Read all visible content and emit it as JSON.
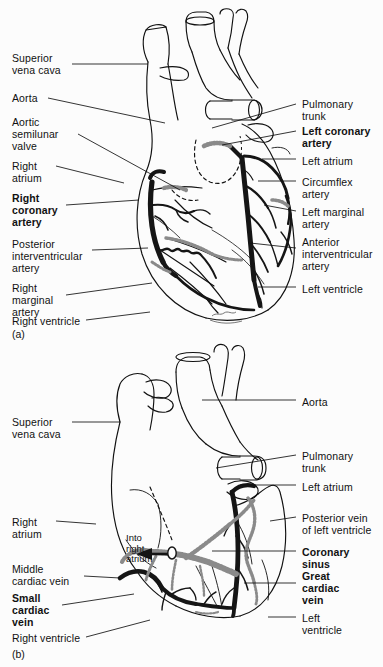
{
  "figure": {
    "background_color": "#fcfcfc",
    "ink_color": "#111111",
    "vessel_dark_color": "#151515",
    "vessel_gray_color": "#8a8a8a"
  },
  "panels": [
    {
      "id": "a",
      "letter": "(a)",
      "view": "anterior view - coronary arteries",
      "labels_left": [
        {
          "text": "Superior\nvena cava",
          "bold": false,
          "x": 12,
          "y": 52,
          "leader_x1": 72,
          "leader_y1": 64,
          "leader_x2": 148,
          "leader_y2": 64
        },
        {
          "text": "Aorta",
          "bold": false,
          "x": 12,
          "y": 92,
          "leader_x1": 48,
          "leader_y1": 98,
          "leader_x2": 165,
          "leader_y2": 123
        },
        {
          "text": "Aortic\nsemilunar\nvalve",
          "bold": false,
          "x": 12,
          "y": 116,
          "leader_x1": 78,
          "leader_y1": 134,
          "leader_x2": 180,
          "leader_y2": 190
        },
        {
          "text": "Right\natrium",
          "bold": false,
          "x": 12,
          "y": 160,
          "leader_x1": 56,
          "leader_y1": 166,
          "leader_x2": 124,
          "leader_y2": 183
        },
        {
          "text": "Right\ncoronary\nartery",
          "bold": true,
          "x": 12,
          "y": 192,
          "leader_x1": 66,
          "leader_y1": 205,
          "leader_x2": 139,
          "leader_y2": 200
        },
        {
          "text": "Posterior\ninterventricular\nartery",
          "bold": false,
          "x": 12,
          "y": 238,
          "leader_x1": 92,
          "leader_y1": 250,
          "leader_x2": 148,
          "leader_y2": 248
        },
        {
          "text": "Right\nmarginal\nartery",
          "bold": false,
          "x": 12,
          "y": 282,
          "leader_x1": 66,
          "leader_y1": 295,
          "leader_x2": 152,
          "leader_y2": 283
        },
        {
          "text": "Right ventricle",
          "bold": false,
          "x": 12,
          "y": 315,
          "leader_x1": 86,
          "leader_y1": 320,
          "leader_x2": 150,
          "leader_y2": 312
        }
      ],
      "labels_right": [
        {
          "text": "Pulmonary\ntrunk",
          "bold": false,
          "x": 302,
          "y": 98,
          "leader_x1": 296,
          "leader_y1": 104,
          "leader_x2": 212,
          "leader_y2": 128
        },
        {
          "text": "Left coronary\nartery",
          "bold": true,
          "x": 302,
          "y": 125,
          "leader_x1": 296,
          "leader_y1": 131,
          "leader_x2": 222,
          "leader_y2": 145
        },
        {
          "text": "Left atrium",
          "bold": false,
          "x": 302,
          "y": 155,
          "leader_x1": 296,
          "leader_y1": 159,
          "leader_x2": 262,
          "leader_y2": 159
        },
        {
          "text": "Circumflex\nartery",
          "bold": false,
          "x": 302,
          "y": 176,
          "leader_x1": 296,
          "leader_y1": 181,
          "leader_x2": 258,
          "leader_y2": 181
        },
        {
          "text": "Left marginal\nartery",
          "bold": false,
          "x": 302,
          "y": 206,
          "leader_x1": 296,
          "leader_y1": 211,
          "leader_x2": 264,
          "leader_y2": 205
        },
        {
          "text": "Anterior\ninterventricular\nartery",
          "bold": false,
          "x": 302,
          "y": 236,
          "leader_x1": 296,
          "leader_y1": 248,
          "leader_x2": 250,
          "leader_y2": 243
        },
        {
          "text": "Left ventricle",
          "bold": false,
          "x": 302,
          "y": 283,
          "leader_x1": 296,
          "leader_y1": 287,
          "leader_x2": 258,
          "leader_y2": 287
        }
      ],
      "annotations": []
    },
    {
      "id": "b",
      "letter": "(b)",
      "view": "posterior view - cardiac veins",
      "labels_left": [
        {
          "text": "Superior\nvena cava",
          "bold": false,
          "x": 12,
          "y": 416,
          "leader_x1": 72,
          "leader_y1": 422,
          "leader_x2": 120,
          "leader_y2": 422
        },
        {
          "text": "Right\natrium",
          "bold": false,
          "x": 12,
          "y": 516,
          "leader_x1": 56,
          "leader_y1": 521,
          "leader_x2": 96,
          "leader_y2": 524
        },
        {
          "text": "Middle\ncardiac  vein",
          "bold": false,
          "x": 12,
          "y": 563,
          "leader_x1": 84,
          "leader_y1": 576,
          "leader_x2": 120,
          "leader_y2": 578
        },
        {
          "text": "Small\ncardiac\nvein",
          "bold": true,
          "x": 12,
          "y": 592,
          "leader_x1": 62,
          "leader_y1": 605,
          "leader_x2": 134,
          "leader_y2": 594
        },
        {
          "text": "Right ventricle",
          "bold": false,
          "x": 12,
          "y": 632,
          "leader_x1": 86,
          "leader_y1": 637,
          "leader_x2": 150,
          "leader_y2": 620
        }
      ],
      "labels_right": [
        {
          "text": "Aorta",
          "bold": false,
          "x": 302,
          "y": 396,
          "leader_x1": 296,
          "leader_y1": 400,
          "leader_x2": 202,
          "leader_y2": 400
        },
        {
          "text": "Pulmonary\ntrunk",
          "bold": false,
          "x": 302,
          "y": 450,
          "leader_x1": 296,
          "leader_y1": 455,
          "leader_x2": 216,
          "leader_y2": 468
        },
        {
          "text": "Left atrium",
          "bold": false,
          "x": 302,
          "y": 481,
          "leader_x1": 296,
          "leader_y1": 485,
          "leader_x2": 240,
          "leader_y2": 485
        },
        {
          "text": "Posterior vein\nof left ventricle",
          "bold": false,
          "x": 302,
          "y": 512,
          "leader_x1": 296,
          "leader_y1": 517,
          "leader_x2": 270,
          "leader_y2": 521
        },
        {
          "text": "Coronary\nsinus",
          "bold": true,
          "x": 302,
          "y": 546,
          "leader_x1": 296,
          "leader_y1": 551,
          "leader_x2": 212,
          "leader_y2": 551
        },
        {
          "text": "Great\ncardiac\nvein",
          "bold": true,
          "x": 302,
          "y": 570,
          "leader_x1": 296,
          "leader_y1": 583,
          "leader_x2": 244,
          "leader_y2": 583
        },
        {
          "text": "Left\nventricle",
          "bold": false,
          "x": 302,
          "y": 612,
          "leader_x1": 296,
          "leader_y1": 617,
          "leader_x2": 268,
          "leader_y2": 617
        }
      ],
      "annotations": [
        {
          "text": "Into\nright\natrium",
          "x": 126,
          "y": 533
        }
      ]
    }
  ]
}
